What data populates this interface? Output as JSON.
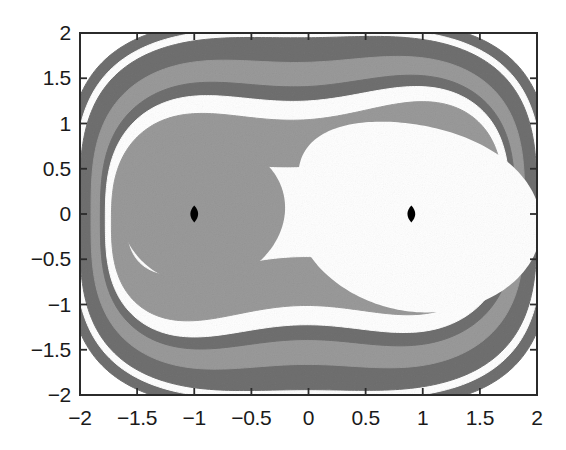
{
  "chart_data": {
    "type": "contour",
    "title": "",
    "xlabel": "",
    "ylabel": "",
    "xlim": [
      -2,
      2
    ],
    "ylim": [
      -2,
      2
    ],
    "xticks": [
      -2,
      -1.5,
      -1,
      -0.5,
      0,
      0.5,
      1,
      1.5,
      2
    ],
    "xticklabels": [
      "-2",
      "-1.5",
      "-1",
      "-0.5",
      "0",
      "0.5",
      "1",
      "1.5",
      "2"
    ],
    "yticks": [
      -2,
      -1.5,
      -1,
      -0.5,
      0,
      0.5,
      1,
      1.5,
      2
    ],
    "yticklabels": [
      "-2",
      "-1.5",
      "-1",
      "-0.5",
      "0",
      "0.5",
      "1",
      "1.5",
      "2"
    ],
    "grid": false,
    "legend": null,
    "markers": [
      {
        "name": "left-fixed-point",
        "x": -1.0,
        "y": 0.0,
        "shape": "diamond",
        "color": "#000000"
      },
      {
        "name": "right-fixed-point",
        "x": 0.9,
        "y": 0.0,
        "shape": "diamond",
        "color": "#000000"
      }
    ],
    "colors": {
      "band_dark": "#707070",
      "band_light": "#9a9a9a",
      "band_white": "#ffffff",
      "background": "#ffffff",
      "axis": "#2b2b2b",
      "marker": "#000000"
    },
    "bands": [
      {
        "level": 1,
        "fill": "#707070",
        "scale": 1.0
      },
      {
        "level": 2,
        "fill": "#ffffff",
        "scale": 0.945
      },
      {
        "level": 3,
        "fill": "#707070",
        "scale": 0.905
      },
      {
        "level": 4,
        "fill": "#9a9a9a",
        "scale": 0.8
      },
      {
        "level": 5,
        "fill": "#707070",
        "scale": 0.7
      },
      {
        "level": 6,
        "fill": "#ffffff",
        "scale": 0.64
      },
      {
        "level": 7,
        "fill": "#9a9a9a",
        "scale": 0.56
      },
      {
        "level": 8,
        "fill": "#ffffff",
        "scale": 0.33
      }
    ],
    "potential": {
      "form": "H(x,y) = y^2/2 - x^2/2 + x^4/4",
      "well_centers_x": [
        -1.0,
        0.9
      ]
    }
  },
  "axes": {
    "frame": {
      "left": 80,
      "top": 33,
      "right": 537,
      "bottom": 395
    },
    "tick_length": 7,
    "line_width": 2
  }
}
